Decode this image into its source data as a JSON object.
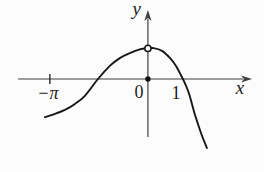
{
  "figure": {
    "background": "#fcfcfc"
  },
  "chart_data": {
    "type": "line",
    "title": "",
    "xlabel": "x",
    "ylabel": "y",
    "xlim": [
      -4.74,
      3.72
    ],
    "ylim": [
      -2.98,
      2.53
    ],
    "grid": false,
    "legend": "none",
    "colors": {
      "axis": "#3f3f3f",
      "curve": "#161616",
      "text": "#1c1c1c",
      "marker_fill": "#111111",
      "open_marker_fill": "#fcfcfc"
    },
    "x_ticks": [
      {
        "value": -3.1416,
        "label": "−π",
        "has_tick_mark": true
      },
      {
        "value": 1,
        "label": "1",
        "has_tick_mark": false
      }
    ],
    "origin_label": "0",
    "series": [
      {
        "name": "function-curve",
        "x": [
          -3.3,
          -2.98,
          -2.66,
          -2.34,
          -2.02,
          -1.6,
          -1.22,
          -0.9,
          -0.58,
          -0.26,
          0.0,
          0.19,
          0.45,
          0.71,
          0.9,
          1.12,
          1.31,
          1.51,
          1.7,
          1.89
        ],
        "y": [
          -1.22,
          -1.12,
          -0.99,
          -0.8,
          -0.54,
          0.0,
          0.42,
          0.67,
          0.83,
          0.95,
          0.98,
          0.99,
          0.9,
          0.67,
          0.42,
          0.0,
          -0.45,
          -1.15,
          -1.73,
          -2.21
        ]
      }
    ],
    "points": [
      {
        "x": 0,
        "y": 0,
        "style": "filled",
        "name": "origin-point"
      },
      {
        "x": 0,
        "y": 0.98,
        "style": "open",
        "name": "maximum-point"
      }
    ]
  }
}
